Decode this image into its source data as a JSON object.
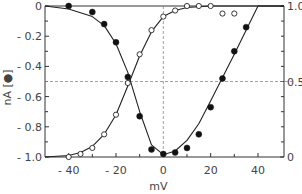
{
  "chart_data": {
    "type": "scatter",
    "title": "",
    "xlabel": "mV",
    "ylabel_left": "nA [●]",
    "ylabel_right": "",
    "xlim": [
      -50,
      51
    ],
    "ylim_left": [
      -1.0,
      0
    ],
    "ylim_right": [
      0,
      1.0
    ],
    "x_ticks": [
      -40,
      -20,
      0,
      20,
      40
    ],
    "x_minor_ticks": [
      -30,
      -10,
      10,
      30
    ],
    "y_left_ticks": [
      0,
      -0.2,
      -0.4,
      -0.6,
      -0.8,
      -1.0
    ],
    "y_left_tick_labels": [
      "0",
      "-0.2",
      "-0.4",
      "-0.6",
      "-0.8",
      "-1.0"
    ],
    "y_right_ticks": [
      0,
      0.5,
      1.0
    ],
    "y_right_tick_labels": [
      "0",
      "0.5",
      "1.0"
    ],
    "grid": false,
    "reference_lines": [
      {
        "orientation": "horizontal",
        "value_left": -0.5,
        "value_right": 0.5,
        "style": "dashed"
      },
      {
        "orientation": "vertical",
        "x": 0,
        "style": "dashed"
      }
    ],
    "series": [
      {
        "name": "Current (nA)",
        "marker": "filled-circle",
        "axis": "left",
        "x": [
          -40,
          -30,
          -25,
          -20,
          -15,
          -10,
          -5,
          0,
          5,
          10,
          15,
          20,
          25,
          30,
          35
        ],
        "y": [
          0.0,
          -0.04,
          -0.12,
          -0.24,
          -0.47,
          -0.73,
          -0.95,
          -0.98,
          -0.97,
          -0.94,
          -0.85,
          -0.67,
          -0.48,
          -0.3,
          -0.14
        ]
      },
      {
        "name": "Normalized (right axis)",
        "marker": "open-circle",
        "axis": "right",
        "x": [
          -40,
          -35,
          -30,
          -25,
          -20,
          -15,
          -10,
          -5,
          0,
          5,
          10,
          15,
          20
        ],
        "y": [
          0.0,
          0.02,
          0.06,
          0.15,
          0.28,
          0.49,
          0.68,
          0.84,
          0.93,
          0.97,
          1.0,
          1.0,
          1.0
        ]
      },
      {
        "name": "Normalized extra points",
        "marker": "open-circle",
        "axis": "right",
        "x": [
          25,
          30
        ],
        "y": [
          0.95,
          0.95
        ]
      }
    ],
    "fit_curves": [
      {
        "name": "I-V fit",
        "axis": "left",
        "x": [
          -50,
          -40,
          -30,
          -25,
          -20,
          -15,
          -10,
          -5,
          0,
          5,
          10,
          15,
          20,
          30,
          40,
          51
        ],
        "y": [
          0.0,
          -0.02,
          -0.07,
          -0.13,
          -0.25,
          -0.44,
          -0.7,
          -0.92,
          -0.985,
          -0.96,
          -0.89,
          -0.78,
          -0.63,
          -0.32,
          0.0,
          0.0
        ]
      },
      {
        "name": "Activation fit",
        "axis": "right",
        "x": [
          -50,
          -40,
          -35,
          -30,
          -25,
          -20,
          -15,
          -10,
          -5,
          0,
          5,
          10,
          20,
          30,
          51
        ],
        "y": [
          0.0,
          0.01,
          0.03,
          0.07,
          0.15,
          0.28,
          0.47,
          0.67,
          0.83,
          0.93,
          0.97,
          0.99,
          1.0,
          1.0,
          1.0
        ]
      }
    ]
  }
}
